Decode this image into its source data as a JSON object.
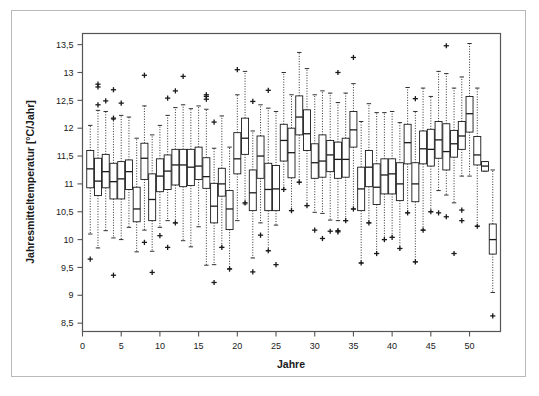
{
  "chart_data": {
    "type": "boxplot",
    "title": "",
    "subtitle": "",
    "xlabel": "Jahre",
    "ylabel": "Jahresmitteltemperatur [°C/Jahr]",
    "xlim": [
      0,
      54
    ],
    "ylim": [
      8.35,
      13.7
    ],
    "xticks": [
      0,
      5,
      10,
      15,
      20,
      25,
      30,
      35,
      40,
      45,
      50
    ],
    "xtick_labels": [
      "0",
      "5",
      "10",
      "15",
      "20",
      "25",
      "30",
      "35",
      "40",
      "45",
      "50"
    ],
    "yticks": [
      8.5,
      9,
      9.5,
      10,
      10.5,
      11,
      11.5,
      12,
      12.5,
      13,
      13.5
    ],
    "ytick_labels": [
      "8,5",
      "9",
      "9,5",
      "10",
      "10,5",
      "11",
      "11,5",
      "12",
      "12,5",
      "13",
      "13,5"
    ],
    "grid": false,
    "legend": null,
    "whisker_style": "dotted",
    "outlier_marker": "+",
    "box_width_px": 7.0,
    "line_color": "#1a1a1a",
    "box_fill": "#ffffff",
    "boxes": [
      {
        "x": 1,
        "q1": 10.93,
        "median": 11.27,
        "q3": 11.6,
        "wlo": 10.1,
        "whi": 12.05,
        "outliers": [
          9.65
        ]
      },
      {
        "x": 2,
        "q1": 10.79,
        "median": 11.05,
        "q3": 11.46,
        "wlo": 9.85,
        "whi": 12.32,
        "outliers": [
          12.74,
          12.79,
          12.42
        ]
      },
      {
        "x": 3,
        "q1": 10.93,
        "median": 11.22,
        "q3": 11.53,
        "wlo": 10.16,
        "whi": 12.3,
        "outliers": [
          12.49
        ]
      },
      {
        "x": 4,
        "q1": 10.73,
        "median": 11.04,
        "q3": 11.37,
        "wlo": 10.03,
        "whi": 12.16,
        "outliers": [
          12.69,
          12.18,
          9.36
        ]
      },
      {
        "x": 5,
        "q1": 10.73,
        "median": 11.09,
        "q3": 11.4,
        "wlo": 10.0,
        "whi": 12.23,
        "outliers": [
          12.45
        ]
      },
      {
        "x": 6,
        "q1": 10.9,
        "median": 11.22,
        "q3": 11.43,
        "wlo": 10.22,
        "whi": 12.2,
        "outliers": []
      },
      {
        "x": 7,
        "q1": 10.32,
        "median": 10.55,
        "q3": 10.94,
        "wlo": 9.78,
        "whi": 11.82,
        "outliers": []
      },
      {
        "x": 8,
        "q1": 11.08,
        "median": 11.46,
        "q3": 11.73,
        "wlo": 10.17,
        "whi": 12.4,
        "outliers": [
          12.95,
          9.95
        ]
      },
      {
        "x": 9,
        "q1": 10.34,
        "median": 10.72,
        "q3": 11.18,
        "wlo": 9.79,
        "whi": 11.88,
        "outliers": [
          9.41
        ]
      },
      {
        "x": 10,
        "q1": 10.86,
        "median": 11.14,
        "q3": 11.45,
        "wlo": 10.22,
        "whi": 12.05,
        "outliers": [
          10.07
        ]
      },
      {
        "x": 11,
        "q1": 10.9,
        "median": 11.23,
        "q3": 11.52,
        "wlo": 10.34,
        "whi": 12.23,
        "outliers": [
          12.54,
          9.86
        ]
      },
      {
        "x": 12,
        "q1": 10.98,
        "median": 11.34,
        "q3": 11.62,
        "wlo": 10.3,
        "whi": 12.37,
        "outliers": [
          12.67,
          10.3
        ]
      },
      {
        "x": 13,
        "q1": 10.95,
        "median": 11.34,
        "q3": 11.62,
        "wlo": 9.98,
        "whi": 12.42,
        "outliers": [
          12.93
        ]
      },
      {
        "x": 14,
        "q1": 10.97,
        "median": 11.3,
        "q3": 11.62,
        "wlo": 9.87,
        "whi": 12.35,
        "outliers": []
      },
      {
        "x": 15,
        "q1": 11.08,
        "median": 11.32,
        "q3": 11.66,
        "wlo": 10.23,
        "whi": 12.4,
        "outliers": []
      },
      {
        "x": 16,
        "q1": 10.92,
        "median": 11.13,
        "q3": 11.47,
        "wlo": 9.54,
        "whi": 12.34,
        "outliers": [
          12.52,
          12.57,
          12.6
        ]
      },
      {
        "x": 17,
        "q1": 10.3,
        "median": 10.6,
        "q3": 11.01,
        "wlo": 9.55,
        "whi": 11.64,
        "outliers": [
          12.11,
          9.23
        ]
      },
      {
        "x": 18,
        "q1": 10.78,
        "median": 11.0,
        "q3": 11.28,
        "wlo": 9.86,
        "whi": 12.22,
        "outliers": [
          9.86
        ]
      },
      {
        "x": 19,
        "q1": 10.18,
        "median": 10.55,
        "q3": 10.88,
        "wlo": 9.48,
        "whi": 11.66,
        "outliers": [
          9.47
        ]
      },
      {
        "x": 20,
        "q1": 11.18,
        "median": 11.45,
        "q3": 11.92,
        "wlo": 10.34,
        "whi": 12.6,
        "outliers": [
          13.05
        ]
      },
      {
        "x": 21,
        "q1": 11.53,
        "median": 11.82,
        "q3": 12.18,
        "wlo": 10.64,
        "whi": 13.02,
        "outliers": [
          10.66
        ]
      },
      {
        "x": 22,
        "q1": 10.52,
        "median": 10.84,
        "q3": 11.25,
        "wlo": 9.67,
        "whi": 11.95,
        "outliers": [
          12.48,
          9.42
        ]
      },
      {
        "x": 23,
        "q1": 11.1,
        "median": 11.5,
        "q3": 11.86,
        "wlo": 10.3,
        "whi": 12.42,
        "outliers": [
          10.08
        ]
      },
      {
        "x": 24,
        "q1": 10.52,
        "median": 10.9,
        "q3": 11.37,
        "wlo": 9.8,
        "whi": 12.36,
        "outliers": [
          12.68,
          9.8
        ]
      },
      {
        "x": 25,
        "q1": 10.52,
        "median": 10.91,
        "q3": 11.33,
        "wlo": 10.26,
        "whi": 12.3,
        "outliers": [
          9.55
        ]
      },
      {
        "x": 26,
        "q1": 11.41,
        "median": 11.78,
        "q3": 12.07,
        "wlo": 10.9,
        "whi": 13.0,
        "outliers": [
          10.9
        ]
      },
      {
        "x": 27,
        "q1": 11.11,
        "median": 11.56,
        "q3": 12.0,
        "wlo": 10.52,
        "whi": 12.6,
        "outliers": [
          10.52
        ]
      },
      {
        "x": 28,
        "q1": 11.88,
        "median": 12.2,
        "q3": 12.58,
        "wlo": 11.03,
        "whi": 13.36,
        "outliers": [
          11.03
        ]
      },
      {
        "x": 29,
        "q1": 11.6,
        "median": 11.9,
        "q3": 12.33,
        "wlo": 10.61,
        "whi": 13.07,
        "outliers": [
          10.61
        ]
      },
      {
        "x": 30,
        "q1": 11.1,
        "median": 11.38,
        "q3": 11.72,
        "wlo": 10.49,
        "whi": 12.6,
        "outliers": [
          10.17
        ]
      },
      {
        "x": 31,
        "q1": 11.12,
        "median": 11.41,
        "q3": 11.88,
        "wlo": 10.47,
        "whi": 12.67,
        "outliers": [
          10.02
        ]
      },
      {
        "x": 32,
        "q1": 11.22,
        "median": 11.52,
        "q3": 11.78,
        "wlo": 10.35,
        "whi": 12.63,
        "outliers": [
          10.15
        ]
      },
      {
        "x": 33,
        "q1": 11.1,
        "median": 11.44,
        "q3": 11.75,
        "wlo": 10.34,
        "whi": 12.46,
        "outliers": [
          13.0,
          10.14,
          10.16
        ]
      },
      {
        "x": 34,
        "q1": 11.12,
        "median": 11.44,
        "q3": 11.82,
        "wlo": 10.34,
        "whi": 12.63,
        "outliers": [
          10.34
        ]
      },
      {
        "x": 35,
        "q1": 11.66,
        "median": 11.97,
        "q3": 12.3,
        "wlo": 10.55,
        "whi": 12.8,
        "outliers": [
          13.27,
          10.55
        ]
      },
      {
        "x": 36,
        "q1": 10.52,
        "median": 10.91,
        "q3": 11.3,
        "wlo": 9.58,
        "whi": 12.12,
        "outliers": [
          9.58
        ]
      },
      {
        "x": 37,
        "q1": 10.95,
        "median": 11.3,
        "q3": 11.6,
        "wlo": 10.3,
        "whi": 12.44,
        "outliers": [
          10.3
        ]
      },
      {
        "x": 38,
        "q1": 10.63,
        "median": 10.94,
        "q3": 11.36,
        "wlo": 9.75,
        "whi": 12.28,
        "outliers": [
          9.75
        ]
      },
      {
        "x": 39,
        "q1": 10.82,
        "median": 11.16,
        "q3": 11.45,
        "wlo": 10.0,
        "whi": 12.28,
        "outliers": [
          10.0
        ]
      },
      {
        "x": 40,
        "q1": 10.82,
        "median": 11.18,
        "q3": 11.45,
        "wlo": 10.04,
        "whi": 12.3,
        "outliers": [
          10.04
        ]
      },
      {
        "x": 41,
        "q1": 10.7,
        "median": 11.0,
        "q3": 11.38,
        "wlo": 9.84,
        "whi": 12.1,
        "outliers": [
          9.84
        ]
      },
      {
        "x": 42,
        "q1": 11.36,
        "median": 11.74,
        "q3": 12.07,
        "wlo": 10.48,
        "whi": 12.73,
        "outliers": [
          10.48
        ]
      },
      {
        "x": 43,
        "q1": 10.68,
        "median": 11.0,
        "q3": 11.38,
        "wlo": 9.6,
        "whi": 12.3,
        "outliers": [
          12.53,
          9.6
        ]
      },
      {
        "x": 44,
        "q1": 11.36,
        "median": 11.63,
        "q3": 11.95,
        "wlo": 10.17,
        "whi": 12.72,
        "outliers": [
          10.17
        ]
      },
      {
        "x": 45,
        "q1": 11.32,
        "median": 11.62,
        "q3": 11.98,
        "wlo": 10.5,
        "whi": 12.57,
        "outliers": [
          10.5
        ]
      },
      {
        "x": 46,
        "q1": 11.46,
        "median": 11.79,
        "q3": 12.12,
        "wlo": 10.88,
        "whi": 13.02,
        "outliers": [
          10.48
        ]
      },
      {
        "x": 47,
        "q1": 11.25,
        "median": 11.58,
        "q3": 12.08,
        "wlo": 10.8,
        "whi": 12.98,
        "outliers": [
          13.48,
          10.41
        ]
      },
      {
        "x": 48,
        "q1": 11.48,
        "median": 11.72,
        "q3": 11.96,
        "wlo": 10.66,
        "whi": 12.72,
        "outliers": [
          9.75
        ]
      },
      {
        "x": 49,
        "q1": 11.62,
        "median": 11.86,
        "q3": 12.12,
        "wlo": 11.14,
        "whi": 12.92,
        "outliers": [
          10.53,
          10.34
        ]
      },
      {
        "x": 50,
        "q1": 11.93,
        "median": 12.26,
        "q3": 12.57,
        "wlo": 11.14,
        "whi": 13.52,
        "outliers": []
      },
      {
        "x": 51,
        "q1": 11.34,
        "median": 11.52,
        "q3": 11.85,
        "wlo": 10.24,
        "whi": 12.72,
        "outliers": [
          10.24
        ]
      },
      {
        "x": 52,
        "q1": 11.23,
        "median": 11.32,
        "q3": 11.4,
        "wlo": 11.23,
        "whi": 11.4,
        "outliers": []
      },
      {
        "x": 53,
        "q1": 9.74,
        "median": 10.0,
        "q3": 10.28,
        "wlo": 9.05,
        "whi": 11.25,
        "outliers": [
          8.63
        ]
      }
    ]
  }
}
